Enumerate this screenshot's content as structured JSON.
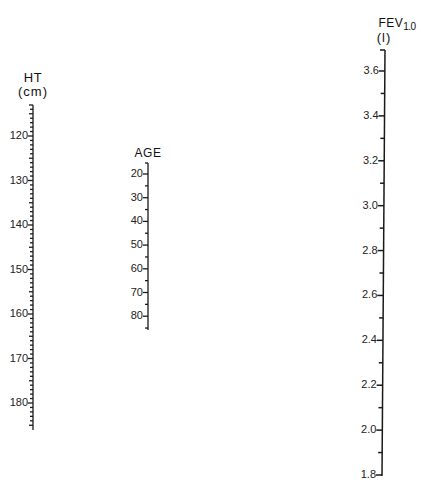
{
  "colors": {
    "ink": "#1a1a1a",
    "background": "#ffffff"
  },
  "scales": {
    "ht": {
      "title": "HT",
      "unit": "(cm)",
      "ticks": [
        "120",
        "130",
        "140",
        "150",
        "160",
        "170",
        "180"
      ],
      "range": [
        113,
        185
      ],
      "minor_step": 1
    },
    "age": {
      "title": "AGE",
      "unit": "",
      "ticks": [
        "20",
        "30",
        "40",
        "50",
        "60",
        "70",
        "80"
      ],
      "range": [
        15,
        85
      ],
      "minor_step": 5
    },
    "fev": {
      "title": "FEV",
      "title_sub": "1.0",
      "unit": "(l)",
      "ticks": [
        "3.6",
        "3.4",
        "3.2",
        "3.0",
        "2.8",
        "2.6",
        "2.4",
        "2.2",
        "2.0",
        "1.8"
      ],
      "range": [
        1.8,
        3.7
      ],
      "minor_step": 0.1
    }
  }
}
